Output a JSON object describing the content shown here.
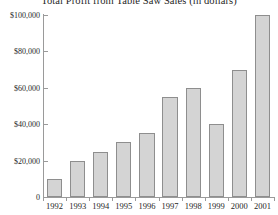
{
  "chart_data": {
    "type": "bar",
    "title": "Total Profit from Table Saw Sales (in dollars)",
    "xlabel": "",
    "ylabel": "",
    "categories": [
      "1992",
      "1993",
      "1994",
      "1995",
      "1996",
      "1997",
      "1998",
      "1999",
      "2000",
      "2001"
    ],
    "values": [
      10000,
      20000,
      25000,
      30000,
      35000,
      55000,
      60000,
      40000,
      70000,
      100000
    ],
    "ylim": [
      0,
      100000
    ],
    "ytick_values": [
      0,
      20000,
      40000,
      60000,
      80000,
      100000
    ],
    "ytick_labels": [
      "0",
      "$20,000",
      "$40,000",
      "$60,000",
      "$80,000",
      "$100,000"
    ],
    "grid": false,
    "legend": null,
    "bar_color": "#d4d4d4",
    "bar_edge_color": "#8e8e8e",
    "axis_color": "#9a9a9a",
    "background": "#ffffff"
  }
}
